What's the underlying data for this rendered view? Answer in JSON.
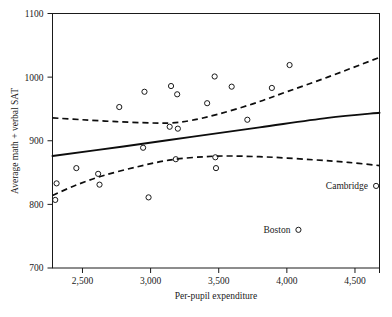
{
  "chart_data": {
    "type": "scatter",
    "title": "",
    "xlabel": "Per-pupil expenditure",
    "ylabel": "Average math + verbal SAT",
    "xlim": [
      2280,
      4680
    ],
    "ylim": [
      700,
      1100
    ],
    "grid": false,
    "legend": null,
    "xticks": [
      2500,
      3000,
      3500,
      4000,
      4500
    ],
    "xtick_labels": [
      "2,500",
      "3,000",
      "3,500",
      "4,000",
      "4,500"
    ],
    "yticks": [
      700,
      800,
      900,
      1000,
      1100
    ],
    "ytick_labels": [
      "700",
      "800",
      "900",
      "1000",
      "1100"
    ],
    "points": [
      {
        "x": 2300,
        "y": 807
      },
      {
        "x": 2310,
        "y": 833
      },
      {
        "x": 2455,
        "y": 857
      },
      {
        "x": 2615,
        "y": 848
      },
      {
        "x": 2625,
        "y": 831
      },
      {
        "x": 2770,
        "y": 953
      },
      {
        "x": 2945,
        "y": 889
      },
      {
        "x": 2955,
        "y": 977
      },
      {
        "x": 2985,
        "y": 811
      },
      {
        "x": 3140,
        "y": 922
      },
      {
        "x": 3150,
        "y": 986
      },
      {
        "x": 3185,
        "y": 871
      },
      {
        "x": 3195,
        "y": 973
      },
      {
        "x": 3200,
        "y": 919
      },
      {
        "x": 3415,
        "y": 959
      },
      {
        "x": 3470,
        "y": 1001
      },
      {
        "x": 3475,
        "y": 874
      },
      {
        "x": 3480,
        "y": 857
      },
      {
        "x": 3595,
        "y": 985
      },
      {
        "x": 3710,
        "y": 933
      },
      {
        "x": 3890,
        "y": 983
      },
      {
        "x": 4020,
        "y": 1019
      },
      {
        "x": 4085,
        "y": 760
      },
      {
        "x": 4655,
        "y": 829
      }
    ],
    "annotations": [
      {
        "label": "Cambridge",
        "x": 4655,
        "y": 829
      },
      {
        "label": "Boston",
        "x": 4085,
        "y": 760
      }
    ],
    "series": [
      {
        "name": "regression-fit",
        "style": "solid",
        "points": [
          {
            "x": 2280,
            "y": 876
          },
          {
            "x": 2800,
            "y": 891
          },
          {
            "x": 3300,
            "y": 906
          },
          {
            "x": 3800,
            "y": 921
          },
          {
            "x": 4300,
            "y": 936
          },
          {
            "x": 4680,
            "y": 944
          }
        ]
      },
      {
        "name": "upper-confidence-band",
        "style": "dashed",
        "points": [
          {
            "x": 2280,
            "y": 936
          },
          {
            "x": 2500,
            "y": 933
          },
          {
            "x": 2750,
            "y": 930
          },
          {
            "x": 3000,
            "y": 928
          },
          {
            "x": 3150,
            "y": 928
          },
          {
            "x": 3300,
            "y": 932
          },
          {
            "x": 3500,
            "y": 942
          },
          {
            "x": 3750,
            "y": 958
          },
          {
            "x": 4000,
            "y": 977
          },
          {
            "x": 4300,
            "y": 1000
          },
          {
            "x": 4680,
            "y": 1031
          }
        ]
      },
      {
        "name": "lower-confidence-band",
        "style": "dashed",
        "points": [
          {
            "x": 2280,
            "y": 814
          },
          {
            "x": 2450,
            "y": 830
          },
          {
            "x": 2650,
            "y": 845
          },
          {
            "x": 2900,
            "y": 859
          },
          {
            "x": 3150,
            "y": 870
          },
          {
            "x": 3400,
            "y": 875
          },
          {
            "x": 3600,
            "y": 876
          },
          {
            "x": 3900,
            "y": 874
          },
          {
            "x": 4200,
            "y": 870
          },
          {
            "x": 4450,
            "y": 866
          },
          {
            "x": 4680,
            "y": 861
          }
        ]
      }
    ]
  }
}
